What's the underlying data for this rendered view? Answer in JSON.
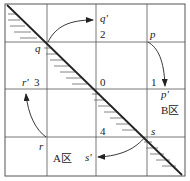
{
  "grid": {
    "cells": "4x4",
    "region_numbers": [
      "0",
      "1",
      "2",
      "3",
      "4"
    ]
  },
  "points": {
    "p": "p",
    "p_prime": "p'",
    "q": "q",
    "q_prime": "q'",
    "r": "r",
    "r_prime": "r'",
    "s": "s",
    "s_prime": "s'"
  },
  "regions": {
    "a": "A区",
    "b": "B区"
  },
  "colors": {
    "line": "#222222",
    "grid": "#555555",
    "hatch": "#666666"
  }
}
